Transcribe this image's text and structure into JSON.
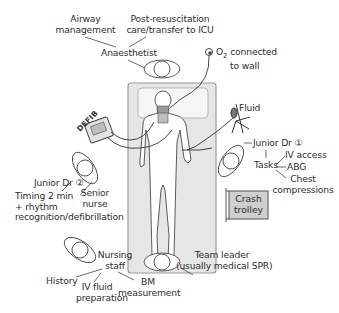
{
  "diagram": {
    "type": "resuscitation-team-layout",
    "colors": {
      "line": "#3a3a3a",
      "bed_fill": "#e6e6e6",
      "bed_border": "#9a9a9a",
      "pillow_fill": "#f4f4f4",
      "trolley_fill": "#cfcfcf",
      "text": "#2e2e2e"
    },
    "anaesthetist": {
      "role": "Anaesthetist",
      "tasks": [
        "Airway management",
        "Post-resuscitation care/transfer to ICU"
      ],
      "task_lines": {
        "airway": [
          "Airway",
          "management"
        ],
        "post": [
          "Post-resuscitation",
          "care/transfer to ICU"
        ]
      }
    },
    "oxygen": {
      "line1_prefix": "O",
      "line1_sub": "2",
      "line1_suffix": " connected",
      "line2": "to wall"
    },
    "defib": {
      "label": "DEFIB"
    },
    "fluid": {
      "label": "Fluid"
    },
    "junior_dr_1": {
      "role": "Junior Dr ①",
      "tasks_label": "Tasks",
      "tasks": [
        "IV access",
        "ABG",
        "Chest compressions"
      ],
      "chest_lines": [
        "Chest",
        "compressions"
      ]
    },
    "crash_trolley": {
      "lines": [
        "Crash",
        "trolley"
      ]
    },
    "junior_dr_2": {
      "role": "Junior Dr ②",
      "task_lines": [
        "Timing 2 min",
        "+ rhythm",
        "recognition/defibrillation"
      ]
    },
    "senior_nurse": {
      "lines": [
        "Senior",
        "nurse"
      ]
    },
    "team_leader": {
      "lines": [
        "Team leader",
        "(usually medical SPR)"
      ]
    },
    "nursing_staff": {
      "role_lines": [
        "Nursing",
        "staff"
      ],
      "tasks": {
        "history": "History",
        "iv_fluid": [
          "IV fluid",
          "preparation"
        ],
        "bm": [
          "BM",
          "measurement"
        ]
      }
    }
  }
}
